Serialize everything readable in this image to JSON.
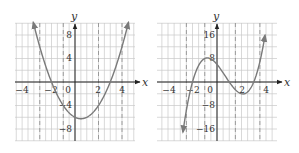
{
  "chart_data": [
    {
      "type": "line",
      "title": "",
      "function": "y = x^2 - x - 6",
      "xlabel": "x",
      "ylabel": "y",
      "xlim": [
        -5,
        5
      ],
      "ylim": [
        -10,
        10
      ],
      "x_ticks": [
        -4,
        0,
        2,
        4
      ],
      "x_tick_labels": [
        "−4",
        "0",
        "2",
        "4"
      ],
      "y_ticks": [
        8,
        4,
        -4,
        -8
      ],
      "y_tick_labels": [
        "8",
        "4",
        "−4",
        "−8"
      ],
      "grid": true,
      "grid_minor_x": 0.5,
      "grid_minor_y": 2,
      "dashed_lines_x": [
        -3,
        -1,
        2,
        4
      ],
      "x_intercepts": [
        -2,
        3
      ],
      "y_intercept": -6,
      "vertex": [
        0.5,
        -6.25
      ],
      "x": [
        -3.5,
        -3,
        -2.5,
        -2,
        -1.5,
        -1,
        -0.5,
        0,
        0.5,
        1,
        1.5,
        2,
        2.5,
        3,
        3.5,
        4,
        4.5
      ],
      "y": [
        9.75,
        6,
        2.75,
        0,
        -2.25,
        -4,
        -5.25,
        -6,
        -6.25,
        -6,
        -5.25,
        -4,
        -2.25,
        0,
        2.75,
        6,
        9.75
      ],
      "arrows": "both ends",
      "curve_color": "#7a7a7a"
    },
    {
      "type": "line",
      "title": "",
      "function": "y = (x + 2)(x - 1)(x - 3)",
      "xlabel": "x",
      "ylabel": "y",
      "xlim": [
        -5,
        5
      ],
      "ylim": [
        -20,
        20
      ],
      "x_ticks": [
        -4,
        -2,
        0,
        2,
        4
      ],
      "x_tick_labels": [
        "−4",
        "−2",
        "0",
        "2",
        "4"
      ],
      "y_ticks": [
        16,
        8,
        -8,
        -16
      ],
      "y_tick_labels": [
        "16",
        "8",
        "−8",
        "−16"
      ],
      "grid": true,
      "grid_minor_x": 0.5,
      "grid_minor_y": 4,
      "dashed_lines_x": [
        -2.5,
        -1,
        1.5,
        3.5
      ],
      "x_intercepts": [
        -2,
        1,
        3
      ],
      "y_intercept": 6,
      "local_max": [
        -0.79,
        8.2
      ],
      "local_min": [
        2.12,
        -4.06
      ],
      "x": [
        -2.9,
        -2.5,
        -2,
        -1.5,
        -1,
        -0.5,
        0,
        0.5,
        1,
        1.5,
        2,
        2.5,
        3,
        3.5,
        3.9
      ],
      "y": [
        -20.5,
        -9.6,
        0,
        5.6,
        8,
        8.1,
        6,
        3.1,
        0,
        -2.6,
        -4,
        -3.4,
        0,
        7.3,
        13.4
      ],
      "arrows": "both ends",
      "curve_color": "#7a7a7a"
    }
  ],
  "graphs": [
    {
      "xlabel": "x",
      "ylabel": "y",
      "x_tick_labels": [
        "−4",
        "0",
        "2",
        "4"
      ],
      "y_tick_labels": [
        "8",
        "4",
        "−4",
        "−8"
      ],
      "neg_x_label_2": "−2"
    },
    {
      "xlabel": "x",
      "ylabel": "y",
      "x_tick_labels": [
        "−4",
        "−2",
        "0",
        "2",
        "4"
      ],
      "y_tick_labels": [
        "16",
        "8",
        "−8",
        "−16"
      ]
    }
  ]
}
